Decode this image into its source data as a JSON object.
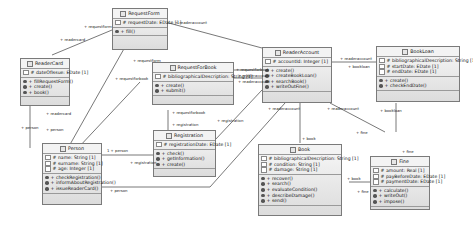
{
  "diagram": {
    "type": "uml-class-diagram",
    "classes": [
      {
        "name": "RequestForm",
        "attributes": [
          "# requestDate: EDate [1]"
        ],
        "operations": [
          "+ fill()"
        ]
      },
      {
        "name": "ReaderCard",
        "attributes": [
          "# dateOfIssue: EDate [1]"
        ],
        "operations": [
          "+ fillRequestForm()",
          "+ create()",
          "+ book()"
        ]
      },
      {
        "name": "RequestForBook",
        "attributes": [
          "# bibliographicalDescription: String [1]"
        ],
        "operations": [
          "+ create()",
          "+ submit()"
        ]
      },
      {
        "name": "Registration",
        "attributes": [
          "# registrationDate: EDate [1]"
        ],
        "operations": [
          "+ check()",
          "+ getInformation()",
          "+ create()"
        ]
      },
      {
        "name": "Person",
        "attributes": [
          "# name: String [1]",
          "# surname: String [1]",
          "# age: Integer [1]"
        ],
        "operations": [
          "+ checkRegistration()",
          "+ informAboutRegistration()",
          "+ issueReaderCard()"
        ]
      },
      {
        "name": "ReaderAccount",
        "attributes": [
          "# accountId: Integer [1]"
        ],
        "operations": [
          "+ create()",
          "+ createBookLoan()",
          "+ searchBook()",
          "+ writeOutFine()"
        ]
      },
      {
        "name": "BookLoan",
        "attributes": [
          "# bibliographicalDescription: String [1]",
          "# startDate: EDate [1]",
          "# endDate: EDate [1]"
        ],
        "operations": [
          "+ create()",
          "+ checkEndDate()"
        ]
      },
      {
        "name": "Book",
        "attributes": [
          "# bibliographicalDescription: String [1]",
          "# condition: String [1]",
          "# damage: String [1]"
        ],
        "operations": [
          "+ recover()",
          "+ search()",
          "+ evaluateCondition()",
          "+ describeDamage()",
          "+ send()"
        ]
      },
      {
        "name": "Fine",
        "attributes": [
          "# amount: Real [1]",
          "# payBeforeDate: EDate [1]",
          "# paymentDate: EDate [1]"
        ],
        "operations": [
          "+ calculate()",
          "+ writeOut()",
          "+ impose()"
        ]
      }
    ],
    "labels": {
      "l1": "+ requestform",
      "l2": "+ readercard",
      "l3": "+ readeraccount",
      "l4": "+ requestform",
      "l5": "+ requestforbook",
      "l6": "+ readercard",
      "l7": "+ person",
      "l8": "+ person",
      "l9": "+ requestforbook",
      "l10": "+ readeraccount",
      "l11": "+ readeraccount",
      "l12": "+ readeraccount",
      "l13": "+ requestforbook",
      "l14": "+ registration",
      "l15": "+ registration",
      "l16": "1 + person",
      "l17": "+ registration",
      "l18": "+ person",
      "l19": "+ bookloan",
      "l20": "+ readeraccount",
      "l21": "+ book",
      "l22": "+ fine",
      "l23": "+ book",
      "l24": "+ fine",
      "l25": "+ fine",
      "l26": "+ bookloan",
      "l27": "+ readeraccount"
    }
  }
}
